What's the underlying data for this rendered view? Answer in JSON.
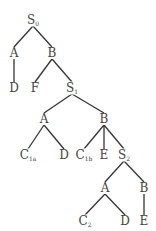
{
  "diagram": {
    "type": "tree",
    "line_color": "#333333",
    "text_color": "#444444",
    "nodes": [
      {
        "id": "n0",
        "label": "S",
        "sub": "0",
        "x": 33,
        "y": 20
      },
      {
        "id": "n1",
        "label": "A",
        "sub": "",
        "x": 14,
        "y": 53
      },
      {
        "id": "n2",
        "label": "B",
        "sub": "",
        "x": 52,
        "y": 53
      },
      {
        "id": "n3",
        "label": "D",
        "sub": "",
        "x": 14,
        "y": 88
      },
      {
        "id": "n4",
        "label": "F",
        "sub": "",
        "x": 35,
        "y": 88
      },
      {
        "id": "n5",
        "label": "S",
        "sub": "1",
        "x": 72,
        "y": 88
      },
      {
        "id": "n6",
        "label": "A",
        "sub": "",
        "x": 44,
        "y": 119
      },
      {
        "id": "n7",
        "label": "B",
        "sub": "",
        "x": 104,
        "y": 119
      },
      {
        "id": "n8",
        "label": "C",
        "sub": "1a",
        "x": 28,
        "y": 155
      },
      {
        "id": "n9",
        "label": "D",
        "sub": "",
        "x": 64,
        "y": 155
      },
      {
        "id": "n10",
        "label": "C",
        "sub": "1b",
        "x": 84,
        "y": 155
      },
      {
        "id": "n11",
        "label": "E",
        "sub": "",
        "x": 104,
        "y": 155
      },
      {
        "id": "n12",
        "label": "S",
        "sub": "2",
        "x": 124,
        "y": 155
      },
      {
        "id": "n13",
        "label": "A",
        "sub": "",
        "x": 105,
        "y": 188
      },
      {
        "id": "n14",
        "label": "B",
        "sub": "",
        "x": 144,
        "y": 188
      },
      {
        "id": "n15",
        "label": "C",
        "sub": "2",
        "x": 85,
        "y": 221
      },
      {
        "id": "n16",
        "label": "D",
        "sub": "",
        "x": 125,
        "y": 221
      },
      {
        "id": "n17",
        "label": "E",
        "sub": "",
        "x": 144,
        "y": 221
      }
    ],
    "edges": [
      [
        "n0",
        "n1"
      ],
      [
        "n0",
        "n2"
      ],
      [
        "n1",
        "n3"
      ],
      [
        "n2",
        "n4"
      ],
      [
        "n2",
        "n5"
      ],
      [
        "n5",
        "n6"
      ],
      [
        "n5",
        "n7"
      ],
      [
        "n6",
        "n8"
      ],
      [
        "n6",
        "n9"
      ],
      [
        "n7",
        "n10"
      ],
      [
        "n7",
        "n11"
      ],
      [
        "n7",
        "n12"
      ],
      [
        "n12",
        "n13"
      ],
      [
        "n12",
        "n14"
      ],
      [
        "n13",
        "n15"
      ],
      [
        "n13",
        "n16"
      ],
      [
        "n14",
        "n17"
      ]
    ]
  }
}
